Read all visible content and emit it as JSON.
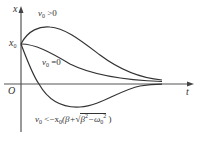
{
  "diagram": {
    "axes": {
      "vertical_label": "x",
      "horizontal_label": "t",
      "origin_label": "O",
      "x0_label": "x",
      "x0_sub": "0"
    },
    "curves": [
      {
        "id": "positive",
        "label_main": "v",
        "label_sub": "0",
        "label_rel": " >0"
      },
      {
        "id": "zero",
        "label_main": "v",
        "label_sub": "0",
        "label_rel": " =0"
      },
      {
        "id": "negative",
        "label_main": "v",
        "label_sub": "0",
        "label_rel": " <−x",
        "label_sub2": "0",
        "label_rest1": "(β+",
        "label_root_a": "β",
        "label_root_a_sup": "2",
        "label_root_b": "−ω",
        "label_root_b_sub": "0",
        "label_root_b_sup": "2",
        "label_close": " )"
      }
    ],
    "colors": {
      "line": "#333333",
      "axis": "#555555"
    }
  }
}
